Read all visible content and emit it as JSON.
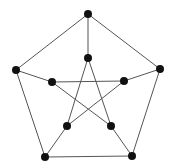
{
  "diagram": {
    "name": "Petersen graph",
    "colors": {
      "edge": "#555555",
      "node": "#111111",
      "background": "#ffffff"
    },
    "node_radius": 4,
    "nodes": [
      {
        "id": "o0",
        "x": 88,
        "y": 14
      },
      {
        "id": "o1",
        "x": 160,
        "y": 69
      },
      {
        "id": "o2",
        "x": 132,
        "y": 156
      },
      {
        "id": "o3",
        "x": 45,
        "y": 157
      },
      {
        "id": "o4",
        "x": 16,
        "y": 70
      },
      {
        "id": "i0",
        "x": 88,
        "y": 58
      },
      {
        "id": "i1",
        "x": 124,
        "y": 81
      },
      {
        "id": "i2",
        "x": 111,
        "y": 126
      },
      {
        "id": "i3",
        "x": 67,
        "y": 126
      },
      {
        "id": "i4",
        "x": 52,
        "y": 82
      }
    ],
    "edges": [
      [
        "o0",
        "o1"
      ],
      [
        "o1",
        "o2"
      ],
      [
        "o2",
        "o3"
      ],
      [
        "o3",
        "o4"
      ],
      [
        "o4",
        "o0"
      ],
      [
        "o0",
        "i0"
      ],
      [
        "o1",
        "i1"
      ],
      [
        "o2",
        "i2"
      ],
      [
        "o3",
        "i3"
      ],
      [
        "o4",
        "i4"
      ],
      [
        "i0",
        "i2"
      ],
      [
        "i0",
        "i3"
      ],
      [
        "i1",
        "i3"
      ],
      [
        "i1",
        "i4"
      ],
      [
        "i4",
        "i2"
      ]
    ]
  }
}
